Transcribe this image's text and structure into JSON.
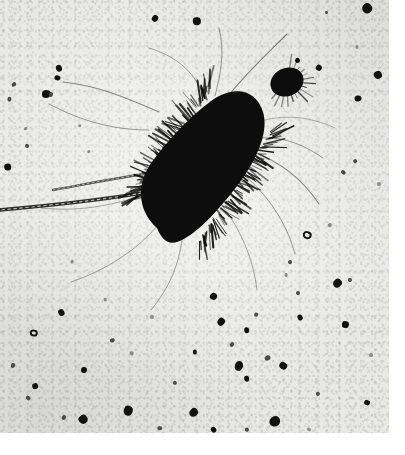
{
  "image": {
    "kind": "electron-micrograph",
    "modality": "transmission electron microscopy, negative stain",
    "palette": {
      "paper_white": "#ffffff",
      "plate_background": "#e8e8e6",
      "specimen_black": "#0a0a0a",
      "appendage_gray": "#3a3a38",
      "debris_dark": "#111111",
      "debris_mid": "#4a4a48",
      "debris_faint": "#8a8a88"
    },
    "plate": {
      "x": 0,
      "y": 0,
      "width": 389,
      "height": 433
    },
    "canvas": {
      "width": 405,
      "height": 455
    }
  },
  "specimen": {
    "label": "rod-shaped bacterium",
    "body": {
      "shape": "rod / bacillus",
      "orientation": "diagonal, lower-left to upper-right",
      "angle_deg": -42,
      "center": {
        "x": 189,
        "y": 170
      },
      "length_px": 178,
      "width_px": 80,
      "fill": "#0a0a0a"
    },
    "surface_appendages": {
      "label": "pili / fimbriae",
      "description": "dense short bristles radiating from the entire cell surface",
      "count": 150,
      "length_px_range": [
        6,
        26
      ],
      "color": "#141414"
    },
    "long_appendages": {
      "label": "flagella",
      "description": "long thin filaments trailing away from the cell",
      "count": 9,
      "color": "#55555a"
    },
    "thick_filament": {
      "label": "beaded flagellum",
      "description": "thick segmented filament running to the left edge of the plate",
      "from": {
        "x": 120,
        "y": 205
      },
      "to": {
        "x": 0,
        "y": 222
      },
      "color": "#1a1a1a"
    },
    "satellite_body": {
      "label": "small round dark body",
      "center": {
        "x": 287,
        "y": 82
      },
      "rx": 17,
      "ry": 14,
      "fill": "#0a0a0a"
    }
  },
  "background_debris": {
    "label": "stain precipitate and debris particles",
    "specks": [
      {
        "x": 46,
        "y": 94,
        "r": 4.5,
        "tone": "dark"
      },
      {
        "x": 14,
        "y": 84,
        "r": 2.0,
        "tone": "mid"
      },
      {
        "x": 57,
        "y": 78,
        "r": 2.5,
        "tone": "dark"
      },
      {
        "x": 59,
        "y": 68,
        "r": 3.0,
        "tone": "dark"
      },
      {
        "x": 155,
        "y": 19,
        "r": 3.2,
        "tone": "dark"
      },
      {
        "x": 197,
        "y": 21,
        "r": 3.8,
        "tone": "dark"
      },
      {
        "x": 367,
        "y": 8,
        "r": 5.0,
        "tone": "dark"
      },
      {
        "x": 327,
        "y": 13,
        "r": 1.6,
        "tone": "mid"
      },
      {
        "x": 378,
        "y": 75,
        "r": 4.0,
        "tone": "dark"
      },
      {
        "x": 319,
        "y": 68,
        "r": 3.0,
        "tone": "dark"
      },
      {
        "x": 8,
        "y": 167,
        "r": 3.6,
        "tone": "dark"
      },
      {
        "x": 27,
        "y": 146,
        "r": 2.2,
        "tone": "mid"
      },
      {
        "x": 9,
        "y": 99,
        "r": 2.4,
        "tone": "mid"
      },
      {
        "x": 26,
        "y": 128,
        "r": 1.8,
        "tone": "faint"
      },
      {
        "x": 51,
        "y": 94,
        "r": 2.0,
        "tone": "mid"
      },
      {
        "x": 358,
        "y": 99,
        "r": 3.0,
        "tone": "dark"
      },
      {
        "x": 343,
        "y": 173,
        "r": 2.2,
        "tone": "mid"
      },
      {
        "x": 379,
        "y": 184,
        "r": 1.8,
        "tone": "faint"
      },
      {
        "x": 355,
        "y": 161,
        "r": 2.0,
        "tone": "mid"
      },
      {
        "x": 307,
        "y": 235,
        "r": 4.2,
        "tone": "ring"
      },
      {
        "x": 290,
        "y": 262,
        "r": 2.0,
        "tone": "mid"
      },
      {
        "x": 214,
        "y": 297,
        "r": 3.6,
        "tone": "dark"
      },
      {
        "x": 286,
        "y": 275,
        "r": 1.8,
        "tone": "faint"
      },
      {
        "x": 337,
        "y": 283,
        "r": 4.4,
        "tone": "dark"
      },
      {
        "x": 350,
        "y": 280,
        "r": 2.0,
        "tone": "mid"
      },
      {
        "x": 300,
        "y": 318,
        "r": 3.0,
        "tone": "dark"
      },
      {
        "x": 256,
        "y": 315,
        "r": 2.2,
        "tone": "mid"
      },
      {
        "x": 247,
        "y": 330,
        "r": 2.6,
        "tone": "dark"
      },
      {
        "x": 232,
        "y": 344,
        "r": 2.0,
        "tone": "mid"
      },
      {
        "x": 34,
        "y": 333,
        "r": 3.6,
        "tone": "ring"
      },
      {
        "x": 61,
        "y": 313,
        "r": 3.2,
        "tone": "dark"
      },
      {
        "x": 13,
        "y": 365,
        "r": 2.2,
        "tone": "mid"
      },
      {
        "x": 35,
        "y": 386,
        "r": 3.0,
        "tone": "dark"
      },
      {
        "x": 28,
        "y": 398,
        "r": 2.2,
        "tone": "mid"
      },
      {
        "x": 84,
        "y": 370,
        "r": 3.0,
        "tone": "dark"
      },
      {
        "x": 83,
        "y": 419,
        "r": 4.4,
        "tone": "dark"
      },
      {
        "x": 128,
        "y": 411,
        "r": 5.0,
        "tone": "dark"
      },
      {
        "x": 112,
        "y": 340,
        "r": 2.4,
        "tone": "mid"
      },
      {
        "x": 175,
        "y": 383,
        "r": 2.0,
        "tone": "mid"
      },
      {
        "x": 195,
        "y": 352,
        "r": 2.6,
        "tone": "dark"
      },
      {
        "x": 194,
        "y": 413,
        "r": 4.6,
        "tone": "dark"
      },
      {
        "x": 239,
        "y": 366,
        "r": 4.2,
        "tone": "dark"
      },
      {
        "x": 268,
        "y": 358,
        "r": 2.6,
        "tone": "mid"
      },
      {
        "x": 283,
        "y": 366,
        "r": 3.4,
        "tone": "dark"
      },
      {
        "x": 247,
        "y": 379,
        "r": 2.6,
        "tone": "dark"
      },
      {
        "x": 275,
        "y": 421,
        "r": 5.0,
        "tone": "dark"
      },
      {
        "x": 345,
        "y": 325,
        "r": 3.4,
        "tone": "dark"
      },
      {
        "x": 298,
        "y": 293,
        "r": 2.0,
        "tone": "mid"
      },
      {
        "x": 367,
        "y": 403,
        "r": 2.8,
        "tone": "dark"
      },
      {
        "x": 318,
        "y": 394,
        "r": 2.0,
        "tone": "mid"
      },
      {
        "x": 221,
        "y": 322,
        "r": 4.0,
        "tone": "dark"
      },
      {
        "x": 152,
        "y": 317,
        "r": 2.0,
        "tone": "faint"
      },
      {
        "x": 105,
        "y": 300,
        "r": 2.0,
        "tone": "faint"
      },
      {
        "x": 72,
        "y": 262,
        "r": 2.0,
        "tone": "faint"
      },
      {
        "x": 132,
        "y": 353,
        "r": 1.8,
        "tone": "faint"
      },
      {
        "x": 64,
        "y": 417,
        "r": 2.0,
        "tone": "mid"
      },
      {
        "x": 160,
        "y": 428,
        "r": 2.0,
        "tone": "mid"
      },
      {
        "x": 214,
        "y": 430,
        "r": 2.6,
        "tone": "dark"
      },
      {
        "x": 371,
        "y": 355,
        "r": 1.8,
        "tone": "faint"
      },
      {
        "x": 330,
        "y": 225,
        "r": 1.8,
        "tone": "faint"
      },
      {
        "x": 89,
        "y": 152,
        "r": 1.6,
        "tone": "faint"
      },
      {
        "x": 80,
        "y": 126,
        "r": 1.6,
        "tone": "faint"
      },
      {
        "x": 298,
        "y": 60,
        "r": 2.6,
        "tone": "dark"
      },
      {
        "x": 357,
        "y": 47,
        "r": 1.8,
        "tone": "faint"
      },
      {
        "x": 247,
        "y": 430,
        "r": 2.0,
        "tone": "mid"
      },
      {
        "x": 309,
        "y": 430,
        "r": 1.8,
        "tone": "faint"
      }
    ]
  }
}
